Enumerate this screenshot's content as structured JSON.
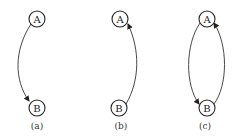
{
  "diagrams": [
    {
      "caption": "(a)",
      "nodes": [
        {
          "label": "A"
        },
        {
          "label": "B"
        }
      ],
      "edges": [
        {
          "from": "A",
          "to": "B",
          "side": "left"
        }
      ]
    },
    {
      "caption": "(b)",
      "nodes": [
        {
          "label": "A"
        },
        {
          "label": "B"
        }
      ],
      "edges": [
        {
          "from": "B",
          "to": "A",
          "side": "right"
        }
      ]
    },
    {
      "caption": "(c)",
      "nodes": [
        {
          "label": "A"
        },
        {
          "label": "B"
        }
      ],
      "edges": [
        {
          "from": "A",
          "to": "B",
          "side": "left"
        },
        {
          "from": "B",
          "to": "A",
          "side": "right"
        }
      ]
    }
  ],
  "colors": {
    "stroke": "#222222",
    "background": "#ffffff"
  }
}
